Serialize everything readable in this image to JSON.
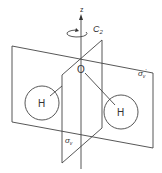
{
  "diagram": {
    "axis": {
      "label": "z"
    },
    "rotation_axis": {
      "label_main": "C",
      "label_sub": "2"
    },
    "central_atom": {
      "label": "O"
    },
    "left_atom": {
      "label": "H"
    },
    "right_atom": {
      "label": "H"
    },
    "plane_back": {
      "label_main": "σ",
      "label_sub": "v",
      "label_prime": "'"
    },
    "plane_front": {
      "label_main": "σ",
      "label_sub": "v"
    },
    "colors": {
      "line": "#333333",
      "background": "#ffffff"
    }
  }
}
